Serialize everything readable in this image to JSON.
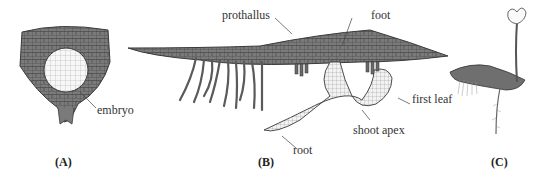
{
  "figure": {
    "panels": [
      {
        "id": "A",
        "label": "(A)",
        "annotations": [
          {
            "text": "embryo"
          }
        ]
      },
      {
        "id": "B",
        "label": "(B)",
        "annotations": [
          {
            "text": "prothallus"
          },
          {
            "text": "foot"
          },
          {
            "text": "first leaf"
          },
          {
            "text": "shoot apex"
          },
          {
            "text": "root"
          }
        ]
      },
      {
        "id": "C",
        "label": "(C)",
        "annotations": []
      }
    ],
    "colors": {
      "tissue_dark": "#7a7a7a",
      "tissue_outline": "#3a3a3a",
      "embryo_fill": "#f4f4f4",
      "sporophyte_fill": "#e8e8e8",
      "background": "#ffffff",
      "label_text": "#333333"
    }
  }
}
